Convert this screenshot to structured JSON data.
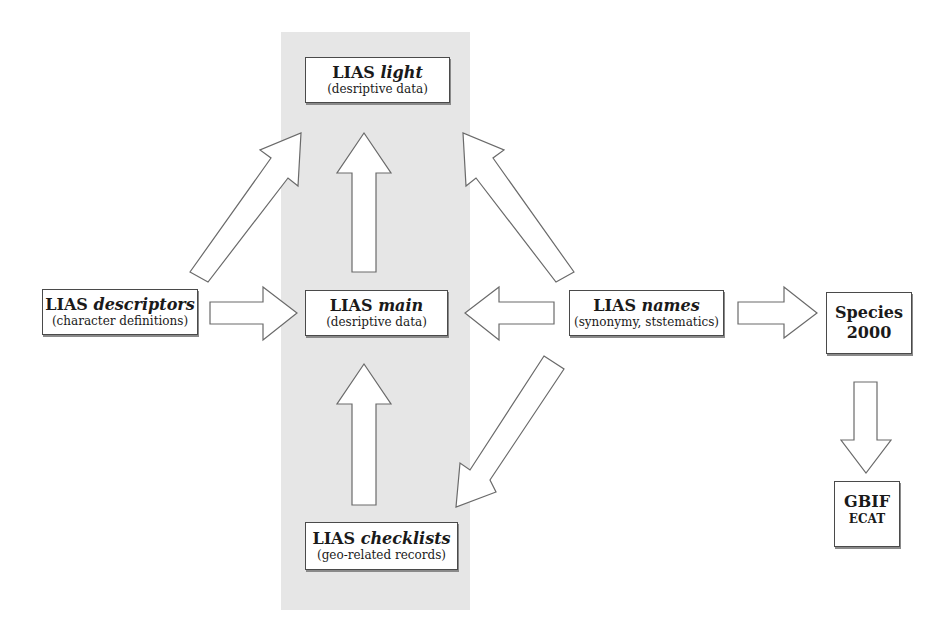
{
  "diagram": {
    "highlight_band_color": "#e6e6e6",
    "nodes": {
      "light": {
        "title": "LIAS",
        "title_italic": "light",
        "subtitle": "(desriptive data)"
      },
      "descriptors": {
        "title": "LIAS",
        "title_italic": "descriptors",
        "subtitle": "(character definitions)"
      },
      "main": {
        "title": "LIAS",
        "title_italic": "main",
        "subtitle": "(desriptive data)"
      },
      "names": {
        "title": "LIAS",
        "title_italic": "names",
        "subtitle": "(synonymy, ststematics)"
      },
      "species2000": {
        "line1": "Species",
        "line2": "2000"
      },
      "checklists": {
        "title": "LIAS",
        "title_italic": "checklists",
        "subtitle": "(geo-related records)"
      },
      "gbif": {
        "line1": "GBIF",
        "line2": "ECAT"
      }
    },
    "edges": [
      {
        "from": "descriptors",
        "to": "light"
      },
      {
        "from": "main",
        "to": "light"
      },
      {
        "from": "names",
        "to": "light"
      },
      {
        "from": "descriptors",
        "to": "main"
      },
      {
        "from": "names",
        "to": "main"
      },
      {
        "from": "checklists",
        "to": "main"
      },
      {
        "from": "names",
        "to": "checklists"
      },
      {
        "from": "names",
        "to": "species2000"
      },
      {
        "from": "species2000",
        "to": "gbif"
      }
    ]
  }
}
